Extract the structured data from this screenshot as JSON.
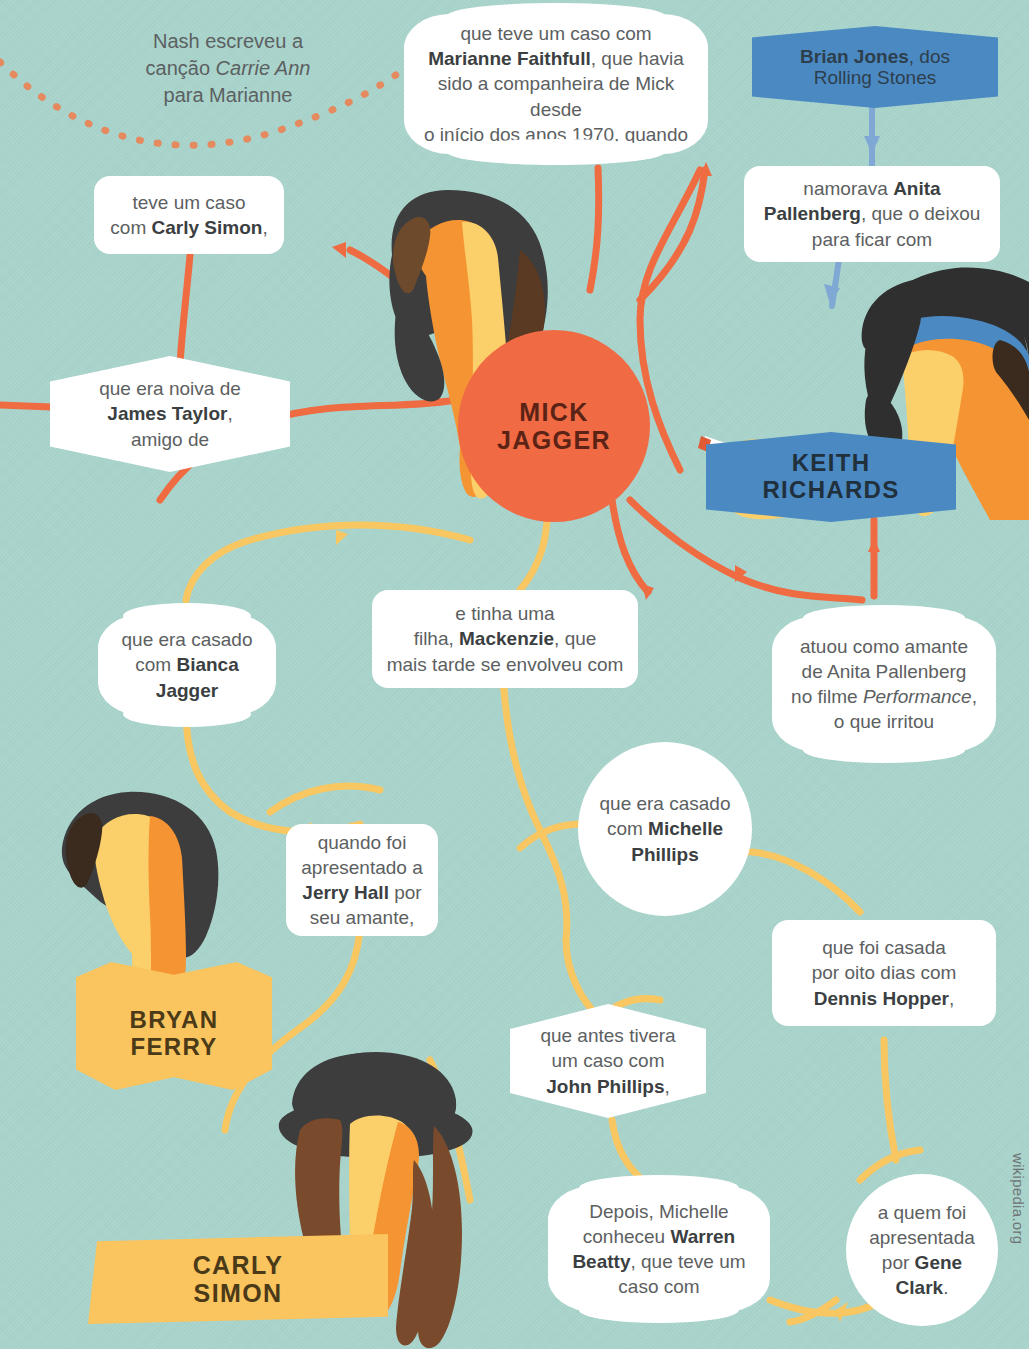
{
  "meta": {
    "background_color": "#a9d4cc",
    "orange": "#ef6b42",
    "yellow": "#f9c762",
    "blue": "#4b89c2",
    "credit": "wikipedia.org"
  },
  "people": [
    {
      "id": "mick",
      "name_line1": "MICK",
      "name_line2": "JAGGER",
      "plate": "circle-orange"
    },
    {
      "id": "keith",
      "name_line1": "KEITH",
      "name_line2": "RICHARDS",
      "plate": "banner-blue"
    },
    {
      "id": "bryan",
      "name_line1": "BRYAN",
      "name_line2": "FERRY",
      "plate": "banner-yellow"
    },
    {
      "id": "carly",
      "name_line1": "CARLY",
      "name_line2": "SIMON",
      "plate": "banner-yellow"
    }
  ],
  "banners": {
    "brian_jones": {
      "bold": "Brian Jones",
      "rest": ", dos",
      "line2": "Rolling Stones"
    }
  },
  "notes": {
    "nash": {
      "line1": "Nash escreveu a",
      "line2_pre": "canção ",
      "line2_em": "Carrie Ann",
      "line3": "para Marianne"
    }
  },
  "callouts": [
    {
      "id": "marianne",
      "shape": "scallop",
      "html": "que teve um caso com<br><b>Marianne Faithfull</b>, que havia<br>sido a companheira de Mick desde<br>o início dos anos 1970, quando"
    },
    {
      "id": "carly-simon-affair",
      "shape": "round",
      "html": "teve um caso<br>com <b>Carly Simon</b>,"
    },
    {
      "id": "james-taylor",
      "shape": "hex",
      "html": "que era noiva de<br><b>James Taylor</b>,<br>amigo de"
    },
    {
      "id": "anita-pallenberg",
      "shape": "round",
      "html": "namorava <b>Anita</b><br><b>Pallenberg</b>, que o deixou<br>para ficar com"
    },
    {
      "id": "bianca-jagger",
      "shape": "scallop",
      "html": "que era casado<br>com <b>Bianca</b><br><b>Jagger</b>"
    },
    {
      "id": "mackenzie",
      "shape": "round",
      "html": "e tinha uma<br>filha, <b>Mackenzie</b>, que<br>mais tarde se envolveu com"
    },
    {
      "id": "performance",
      "shape": "scallop",
      "html": "atuou como amante<br>de Anita Pallenberg<br>no filme <i>Performance</i>,<br>o que irritou"
    },
    {
      "id": "michelle-phillips",
      "shape": "circle",
      "html": "que era casado<br>com <b>Michelle</b><br><b>Phillips</b>"
    },
    {
      "id": "jerry-hall",
      "shape": "round",
      "html": "quando foi<br>apresentado a<br><b>Jerry Hall</b> por<br>seu amante,"
    },
    {
      "id": "dennis-hopper",
      "shape": "round",
      "html": "que foi casada<br>por oito dias com<br><b>Dennis Hopper</b>,"
    },
    {
      "id": "john-phillips",
      "shape": "hex",
      "html": "que antes tivera<br>um caso com<br><b>John Phillips</b>,"
    },
    {
      "id": "warren-beatty",
      "shape": "scallop",
      "html": "Depois, Michelle<br>conheceu <b>Warren</b><br><b>Beatty</b>, que teve um<br>caso com"
    },
    {
      "id": "gene-clark",
      "shape": "circle",
      "html": "a quem foi<br>apresentada<br>por <b>Gene</b><br><b>Clark</b>."
    }
  ]
}
